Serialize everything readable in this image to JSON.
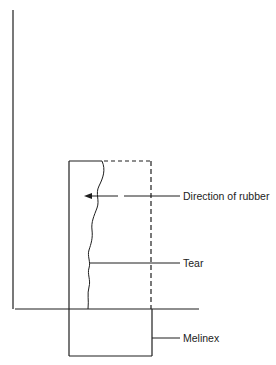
{
  "diagram": {
    "type": "schematic",
    "colors": {
      "line": "#1e1e1e",
      "background": "#ffffff"
    },
    "labels": {
      "direction": "Direction of rubber",
      "tear": "Tear",
      "melinex": "Melinex"
    }
  }
}
